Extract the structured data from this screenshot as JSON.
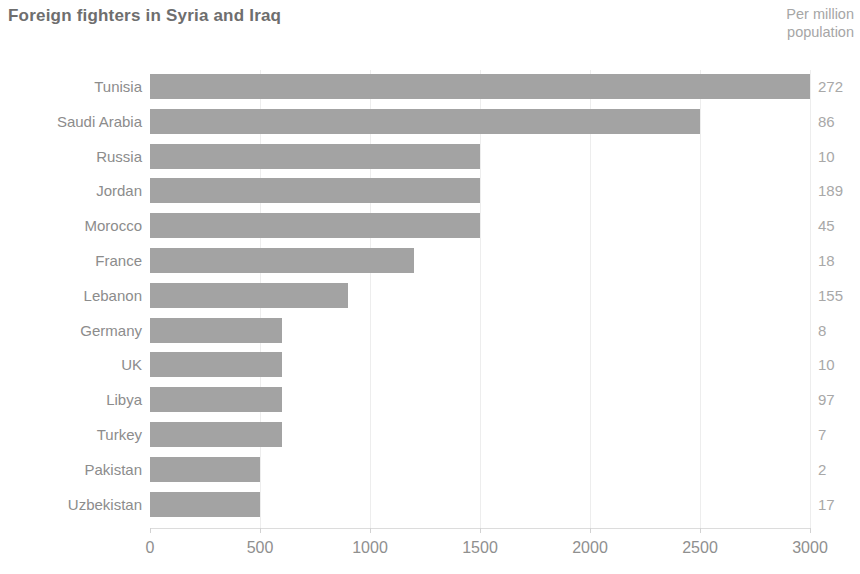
{
  "chart_data": {
    "type": "bar",
    "orientation": "horizontal",
    "title": "Foreign fighters in Syria and Iraq",
    "unit_label_line1": "Per million",
    "unit_label_line2": "population",
    "xlabel": "",
    "ylabel": "",
    "xlim": [
      0,
      3000
    ],
    "grid": true,
    "grid_axis": "x",
    "legend": "none",
    "bar_color": "#a3a3a3",
    "background_color": "#ffffff",
    "text_color": "#8c8c8c",
    "xticks": [
      0,
      500,
      1000,
      1500,
      2000,
      2500,
      3000
    ],
    "xtick_labels": [
      "0",
      "500",
      "1000",
      "1500",
      "2000",
      "2500",
      "3000"
    ],
    "categories": [
      "Tunisia",
      "Saudi Arabia",
      "Russia",
      "Jordan",
      "Morocco",
      "France",
      "Lebanon",
      "Germany",
      "UK",
      "Libya",
      "Turkey",
      "Pakistan",
      "Uzbekistan"
    ],
    "values": [
      3000,
      2500,
      1500,
      1500,
      1500,
      1200,
      900,
      600,
      600,
      600,
      600,
      500,
      500
    ],
    "series": [
      {
        "name": "Foreign fighters",
        "values": [
          3000,
          2500,
          1500,
          1500,
          1500,
          1200,
          900,
          600,
          600,
          600,
          600,
          500,
          500
        ]
      }
    ],
    "secondary_column": {
      "name": "Per million population",
      "values": [
        272,
        86,
        10,
        189,
        45,
        18,
        155,
        8,
        10,
        97,
        7,
        2,
        17
      ]
    },
    "rows": [
      {
        "country": "Tunisia",
        "fighters": 3000,
        "per_million": "272"
      },
      {
        "country": "Saudi Arabia",
        "fighters": 2500,
        "per_million": "86"
      },
      {
        "country": "Russia",
        "fighters": 1500,
        "per_million": "10"
      },
      {
        "country": "Jordan",
        "fighters": 1500,
        "per_million": "189"
      },
      {
        "country": "Morocco",
        "fighters": 1500,
        "per_million": "45"
      },
      {
        "country": "France",
        "fighters": 1200,
        "per_million": "18"
      },
      {
        "country": "Lebanon",
        "fighters": 900,
        "per_million": "155"
      },
      {
        "country": "Germany",
        "fighters": 600,
        "per_million": "8"
      },
      {
        "country": "UK",
        "fighters": 600,
        "per_million": "10"
      },
      {
        "country": "Libya",
        "fighters": 600,
        "per_million": "97"
      },
      {
        "country": "Turkey",
        "fighters": 600,
        "per_million": "7"
      },
      {
        "country": "Pakistan",
        "fighters": 500,
        "per_million": "2"
      },
      {
        "country": "Uzbekistan",
        "fighters": 500,
        "per_million": "17"
      }
    ]
  }
}
